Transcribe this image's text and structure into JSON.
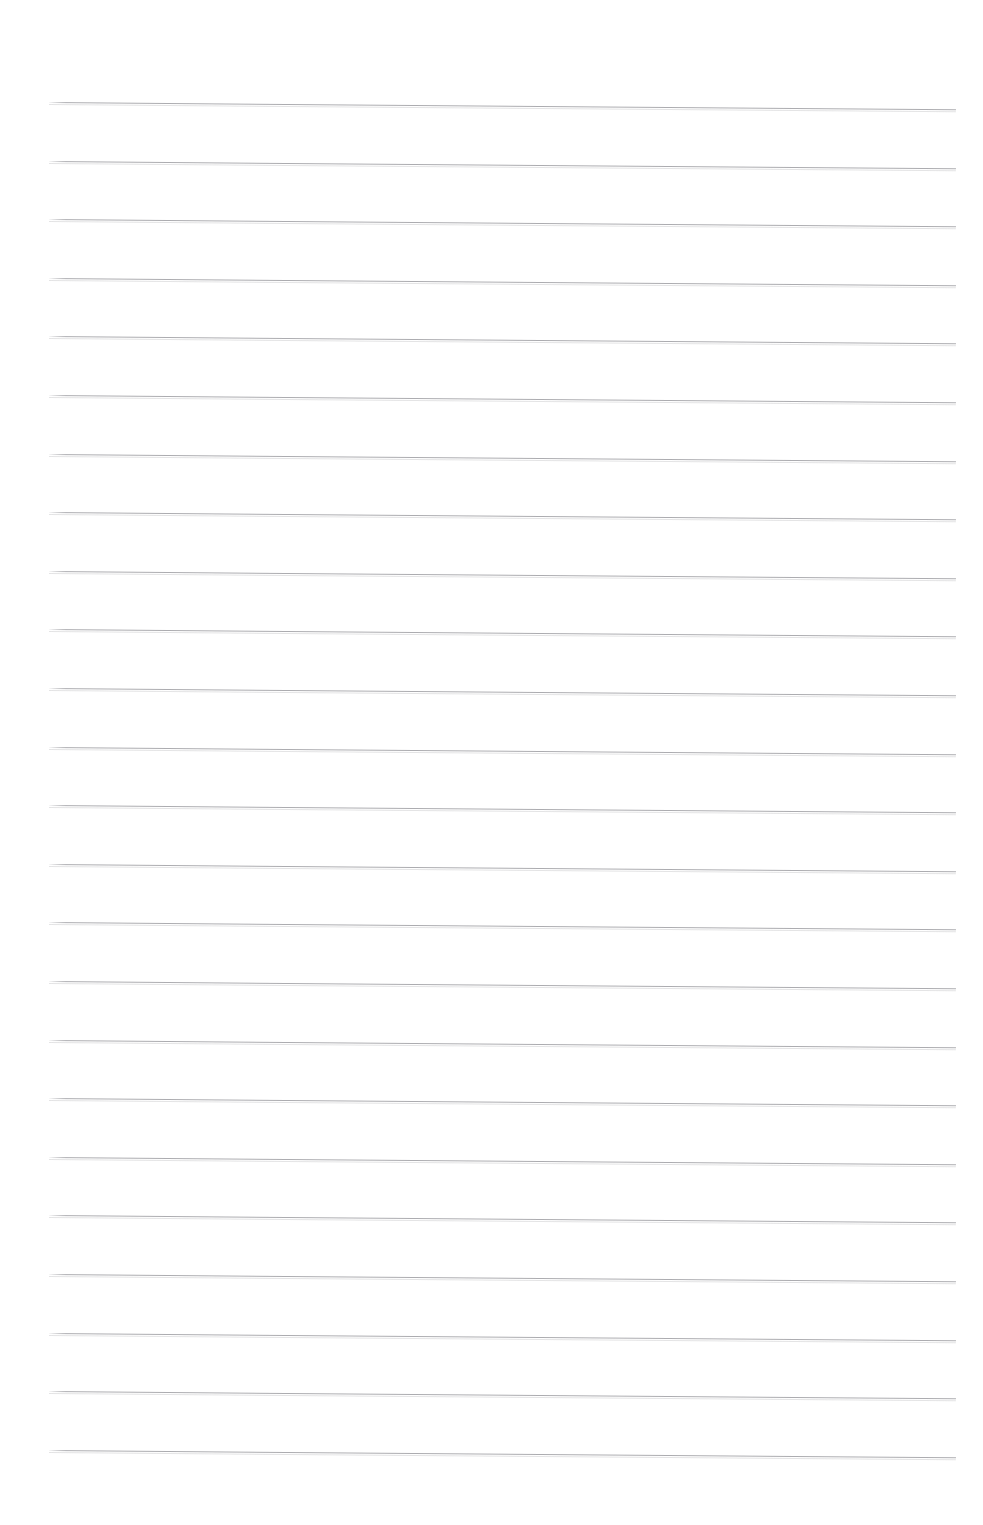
{
  "document": {
    "kind": "scanned-page",
    "page_title": "",
    "page_body_text": "",
    "background_color": "#ffffff",
    "ink_color": "#a8a8ac",
    "width_px": 983,
    "height_px": 1525
  },
  "ruling": {
    "style": "wide-ruled-horizontal",
    "line_count": 24,
    "line_color": "#a8a8ac",
    "line_thickness_px": 1,
    "line_left_px": 49,
    "line_right_px": 956,
    "line_length_px": 907,
    "first_line_y_px": 102,
    "line_spacing_px": 58.6,
    "skew_degrees": 0.46,
    "margin_rule": "none",
    "holes": "none"
  },
  "lines": [
    {
      "index": 1,
      "y": 102,
      "text": ""
    },
    {
      "index": 2,
      "y": 160.6,
      "text": ""
    },
    {
      "index": 3,
      "y": 219.2,
      "text": ""
    },
    {
      "index": 4,
      "y": 277.8,
      "text": ""
    },
    {
      "index": 5,
      "y": 336.4,
      "text": ""
    },
    {
      "index": 6,
      "y": 395.0,
      "text": ""
    },
    {
      "index": 7,
      "y": 453.6,
      "text": ""
    },
    {
      "index": 8,
      "y": 512.2,
      "text": ""
    },
    {
      "index": 9,
      "y": 570.8,
      "text": ""
    },
    {
      "index": 10,
      "y": 629.4,
      "text": ""
    },
    {
      "index": 11,
      "y": 688.0,
      "text": ""
    },
    {
      "index": 12,
      "y": 746.6,
      "text": ""
    },
    {
      "index": 13,
      "y": 805.2,
      "text": ""
    },
    {
      "index": 14,
      "y": 863.8,
      "text": ""
    },
    {
      "index": 15,
      "y": 922.4,
      "text": ""
    },
    {
      "index": 16,
      "y": 981.0,
      "text": ""
    },
    {
      "index": 17,
      "y": 1039.6,
      "text": ""
    },
    {
      "index": 18,
      "y": 1098.2,
      "text": ""
    },
    {
      "index": 19,
      "y": 1156.8,
      "text": ""
    },
    {
      "index": 20,
      "y": 1215.4,
      "text": ""
    },
    {
      "index": 21,
      "y": 1274.0,
      "text": ""
    },
    {
      "index": 22,
      "y": 1332.6,
      "text": ""
    },
    {
      "index": 23,
      "y": 1391.2,
      "text": ""
    },
    {
      "index": 24,
      "y": 1449.8,
      "text": ""
    }
  ],
  "margins": {
    "top_blank_px": 102,
    "bottom_blank_px": 75,
    "left_blank_px": 49,
    "right_blank_px": 27
  }
}
